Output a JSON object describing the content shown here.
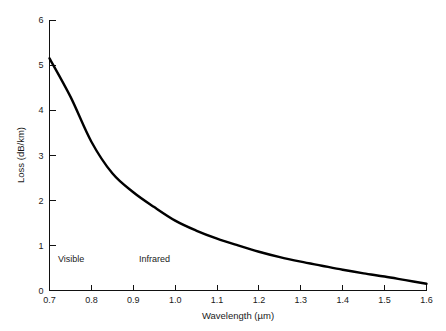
{
  "chart_data": {
    "type": "line",
    "title": "",
    "xlabel": "Wavelength (µm)",
    "ylabel": "Loss (dB/km)",
    "xlim": [
      0.7,
      1.6
    ],
    "ylim": [
      0,
      6
    ],
    "grid": false,
    "legend": "none",
    "xticks": [
      "0.7",
      "0.8",
      "0.9",
      "1.0",
      "1.1",
      "1.2",
      "1.3",
      "1.4",
      "1.5",
      "1.6"
    ],
    "xtick_values": [
      0.7,
      0.8,
      0.9,
      1.0,
      1.1,
      1.2,
      1.3,
      1.4,
      1.5,
      1.6
    ],
    "yticks": [
      "0",
      "1",
      "2",
      "3",
      "4",
      "5",
      "6"
    ],
    "ytick_values": [
      0,
      1,
      2,
      3,
      4,
      5,
      6
    ],
    "series": [
      {
        "name": "Fiber attenuation",
        "x": [
          0.7,
          0.75,
          0.8,
          0.85,
          0.9,
          0.95,
          1.0,
          1.05,
          1.1,
          1.15,
          1.2,
          1.25,
          1.3,
          1.35,
          1.4,
          1.45,
          1.5,
          1.55,
          1.6
        ],
        "values": [
          5.15,
          4.3,
          3.3,
          2.6,
          2.18,
          1.85,
          1.55,
          1.33,
          1.15,
          1.0,
          0.86,
          0.74,
          0.64,
          0.55,
          0.46,
          0.38,
          0.31,
          0.23,
          0.15
        ]
      }
    ],
    "annotations": [
      {
        "text": "Visible",
        "x": 0.72,
        "y": 0.68
      },
      {
        "text": "Infrared",
        "x": 0.9,
        "y": 0.68
      }
    ]
  },
  "axes": {
    "x_title": "Wavelength (µm)",
    "y_title": "Loss (dB/km)"
  },
  "regions": {
    "visible_label": "Visible",
    "infrared_label": "Infrared"
  },
  "colors": {
    "curve": "#000000",
    "axis": "#111111",
    "text": "#1a1a1a",
    "background": "#ffffff"
  }
}
